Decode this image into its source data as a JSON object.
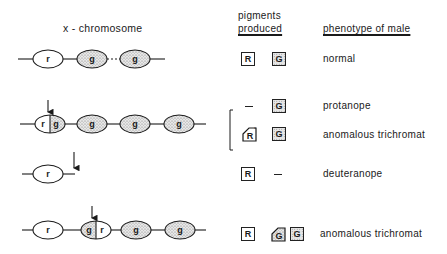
{
  "headers": {
    "chromosome": "x - chromosome",
    "pigments_line1": "pigments",
    "pigments_line2": "produced",
    "phenotype": "phenotype of male"
  },
  "gene_labels": {
    "red": "r",
    "green": "g"
  },
  "pigment_labels": {
    "red": "R",
    "green": "G",
    "none": "–"
  },
  "rows": [
    {
      "genes": [
        "r",
        "g",
        "g"
      ],
      "note": "dotted link between second and third g",
      "pigments": [
        "R",
        "G"
      ],
      "phenotype": "normal"
    },
    {
      "genes": [
        "r|g hybrid",
        "g",
        "g",
        "g"
      ],
      "arrow": "crossover point inside first gene",
      "outcomes": [
        {
          "pigments": [
            "–",
            "G"
          ],
          "phenotype": "protanope"
        },
        {
          "pigments": [
            "R (hybrid)",
            "G"
          ],
          "phenotype": "anomalous trichromat"
        }
      ]
    },
    {
      "genes": [
        "r"
      ],
      "arrow": "deletion after r",
      "pigments": [
        "R",
        "–"
      ],
      "phenotype": "deuteranope"
    },
    {
      "genes": [
        "r",
        "g|r hybrid",
        "g",
        "g"
      ],
      "arrow": "crossover point inside second gene",
      "pigments": [
        "R",
        "G (hybrid)",
        "G"
      ],
      "phenotype": "anomalous trichromat"
    }
  ],
  "colors": {
    "ink": "#1a1a1a",
    "stipple_bg": "#e6e6e6",
    "stipple_dot": "#888888"
  }
}
